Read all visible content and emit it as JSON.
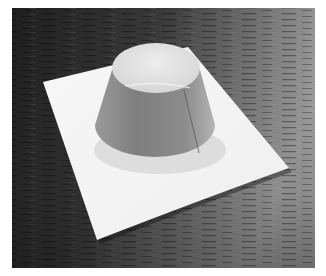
{
  "image": {
    "alt": "Paper truncated cone (frustum) model standing on a white sheet of paper on a dark wooden table",
    "subject": "paper frustum model",
    "colors": {
      "border": "#ffffff",
      "table_dark": "#262626",
      "table_light": "#a0a0a0",
      "paper_sheet": "#f4f4f4",
      "cone_side": "#8a8a8a",
      "cone_inner": "#e6e6e6"
    }
  }
}
